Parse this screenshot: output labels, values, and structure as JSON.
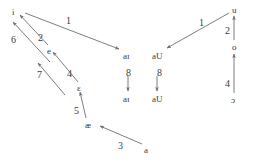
{
  "diagram": {
    "stroke_color": "#6e6e6e",
    "text_color": "#3a3a3a",
    "background": "#ffffff",
    "width": 254,
    "height": 163,
    "vowels": [
      {
        "id": "i-top",
        "text": "i",
        "x": 12,
        "y": 8,
        "type": "symbol"
      },
      {
        "id": "e-mid",
        "text": "e",
        "x": 47,
        "y": 47,
        "type": "symbol"
      },
      {
        "id": "eps",
        "text": "ɛ",
        "x": 77,
        "y": 84,
        "type": "symbol"
      },
      {
        "id": "ae",
        "text": "æ",
        "x": 85,
        "y": 121,
        "type": "symbol"
      },
      {
        "id": "a-low",
        "text": "a",
        "x": 144,
        "y": 146,
        "type": "symbol"
      },
      {
        "id": "ai-upper",
        "text": "aɪ",
        "x": 123,
        "y": 52,
        "type": "symbol"
      },
      {
        "id": "ai-lower",
        "text": "aɪ",
        "x": 123,
        "y": 95,
        "type": "symbol"
      },
      {
        "id": "aU-upper",
        "text": "aU",
        "x": 152,
        "y": 52,
        "type": "symbol"
      },
      {
        "id": "aU-lower",
        "text": "aU",
        "x": 152,
        "y": 95,
        "type": "symbol"
      },
      {
        "id": "u-top",
        "text": "u",
        "x": 232,
        "y": 6,
        "type": "symbol"
      },
      {
        "id": "o-mid",
        "text": "o",
        "x": 232,
        "y": 43,
        "type": "symbol"
      },
      {
        "id": "open-o",
        "text": "ɔ",
        "x": 231,
        "y": 96,
        "type": "symbol"
      }
    ],
    "rule_labels": [
      {
        "id": "rule-1-left",
        "text": "1",
        "x": 66,
        "y": 16
      },
      {
        "id": "rule-6",
        "text": "6",
        "x": 11,
        "y": 35
      },
      {
        "id": "rule-2-left",
        "text": "2",
        "x": 38,
        "y": 33
      },
      {
        "id": "rule-7",
        "text": "7",
        "x": 37,
        "y": 70
      },
      {
        "id": "rule-4-left",
        "text": "4",
        "x": 67,
        "y": 69
      },
      {
        "id": "rule-5",
        "text": "5",
        "x": 74,
        "y": 106
      },
      {
        "id": "rule-3",
        "text": "3",
        "x": 118,
        "y": 141
      },
      {
        "id": "rule-8-left",
        "text": "8",
        "x": 126,
        "y": 68
      },
      {
        "id": "rule-8-right",
        "text": "8",
        "x": 157,
        "y": 68
      },
      {
        "id": "rule-1-right",
        "text": "1",
        "x": 199,
        "y": 18
      },
      {
        "id": "rule-2-right",
        "text": "2",
        "x": 225,
        "y": 26
      },
      {
        "id": "rule-4-right",
        "text": "4",
        "x": 225,
        "y": 79
      }
    ],
    "arrows": [
      {
        "id": "arrow-i-to-ai",
        "x1": 25,
        "y1": 13,
        "x2": 119,
        "y2": 49,
        "head": "end"
      },
      {
        "id": "arrow-e-to-i",
        "x1": 48,
        "y1": 45,
        "x2": 20,
        "y2": 15,
        "head": "end"
      },
      {
        "id": "arrow-eps-to-e",
        "x1": 78,
        "y1": 82,
        "x2": 53,
        "y2": 52,
        "head": "end"
      },
      {
        "id": "arrow-long-to-i",
        "x1": 50,
        "y1": 62,
        "x2": 13,
        "y2": 22,
        "head": "end"
      },
      {
        "id": "arrow-7-to-e",
        "x1": 65,
        "y1": 95,
        "x2": 38,
        "y2": 63,
        "head": "end"
      },
      {
        "id": "arrow-ae-to-eps",
        "x1": 86,
        "y1": 118,
        "x2": 80,
        "y2": 92,
        "head": "end"
      },
      {
        "id": "arrow-a-to-ae",
        "x1": 142,
        "y1": 144,
        "x2": 100,
        "y2": 126,
        "head": "end"
      },
      {
        "id": "arrow-ai-down",
        "x1": 128,
        "y1": 76,
        "x2": 128,
        "y2": 91,
        "head": "end"
      },
      {
        "id": "arrow-aU-down",
        "x1": 157,
        "y1": 76,
        "x2": 157,
        "y2": 91,
        "head": "end"
      },
      {
        "id": "arrow-u-to-aU",
        "x1": 229,
        "y1": 13,
        "x2": 167,
        "y2": 48,
        "head": "end"
      },
      {
        "id": "arrow-o-to-u",
        "x1": 234,
        "y1": 40,
        "x2": 234,
        "y2": 16,
        "head": "end"
      },
      {
        "id": "arrow-openo-to-o",
        "x1": 234,
        "y1": 93,
        "x2": 234,
        "y2": 54,
        "head": "end"
      }
    ]
  }
}
